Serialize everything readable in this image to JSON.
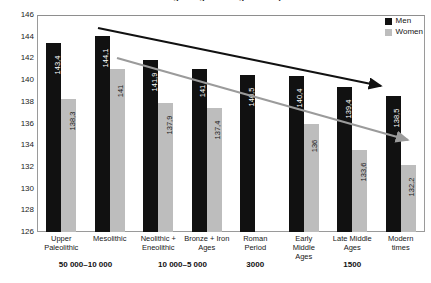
{
  "chart_data": {
    "type": "bar",
    "title": "Average height through history",
    "categories": [
      "Upper\nPaleolithic",
      "Mesolithic",
      "Neolithic +\nEneolithic",
      "Bronze + Iron\nAges",
      "Roman\nPeriod",
      "Early\nMiddle\nAges",
      "Late Middle\nAges",
      "Modern\ntimes"
    ],
    "series": [
      {
        "name": "Men",
        "color": "#111111",
        "values": [
          143.4,
          144.1,
          141.9,
          141,
          140.5,
          140.4,
          139.4,
          138.5
        ]
      },
      {
        "name": "Women",
        "color": "#bdbdbd",
        "values": [
          138.3,
          141,
          137.9,
          137.4,
          null,
          136,
          133.6,
          132.2
        ]
      }
    ],
    "xlabel": "",
    "ylabel": "",
    "ylim": [
      126,
      146
    ],
    "yticks": [
      146,
      144,
      142,
      140,
      138,
      136,
      134,
      132,
      130,
      128,
      126
    ],
    "grid": false,
    "legend_position": "top-right",
    "period_bands": [
      {
        "label": "50 000–10 000",
        "start_category": 0,
        "end_category": 1
      },
      {
        "label": "10 000–5 000",
        "start_category": 2,
        "end_category": 3
      },
      {
        "label": "3000",
        "start_category": 4,
        "end_category": 4
      },
      {
        "label": "1500",
        "start_category": 6,
        "end_category": 6
      }
    ],
    "annotations": [
      {
        "name": "men-trend-arrow",
        "type": "arrow",
        "color": "#111111",
        "description": "declining trend arrow over men bars"
      },
      {
        "name": "women-trend-arrow",
        "type": "arrow",
        "color": "#999999",
        "description": "declining trend arrow over women bars"
      }
    ]
  },
  "legend": {
    "items": [
      {
        "label": "Men",
        "color": "#111111"
      },
      {
        "label": "Women",
        "color": "#bdbdbd"
      }
    ]
  }
}
